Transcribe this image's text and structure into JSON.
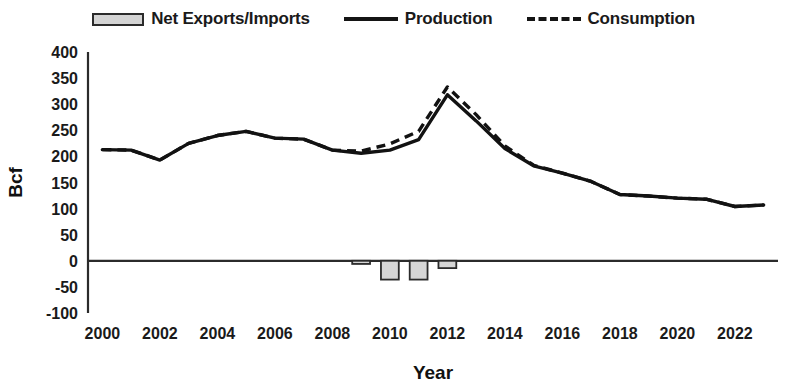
{
  "legend": {
    "items": [
      {
        "label": "Net Exports/Imports",
        "marker": "bar-swatch-icon"
      },
      {
        "label": "Production",
        "marker": "solid-line-icon"
      },
      {
        "label": "Consumption",
        "marker": "dashed-line-icon"
      }
    ]
  },
  "axes": {
    "ylabel": "Bcf",
    "xlabel": "Year",
    "y_ticks": [
      "400",
      "350",
      "300",
      "250",
      "200",
      "150",
      "100",
      "50",
      "0",
      "-50",
      "-100"
    ],
    "x_ticks": [
      "2000",
      "2002",
      "2004",
      "2006",
      "2008",
      "2010",
      "2012",
      "2014",
      "2016",
      "2018",
      "2020",
      "2022"
    ]
  },
  "colors": {
    "line": "#121212",
    "bar_fill": "#d6d6d6",
    "bar_stroke": "#2b2b2b",
    "axis": "#2b2b2b",
    "background": "#ffffff"
  },
  "chart_data": {
    "type": "line",
    "title": "",
    "xlabel": "Year",
    "ylabel": "Bcf",
    "xlim": [
      1999.5,
      2023.5
    ],
    "ylim": [
      -100,
      400
    ],
    "ytick_step": 50,
    "xtick_step": 2,
    "grid": false,
    "legend_position": "top",
    "x": [
      2000,
      2001,
      2002,
      2003,
      2004,
      2005,
      2006,
      2007,
      2008,
      2009,
      2010,
      2011,
      2012,
      2013,
      2014,
      2015,
      2016,
      2017,
      2018,
      2019,
      2020,
      2021,
      2022,
      2023
    ],
    "series": [
      {
        "name": "Production",
        "type": "line",
        "style": "solid",
        "values": [
          213,
          212,
          193,
          225,
          240,
          248,
          235,
          233,
          212,
          206,
          212,
          232,
          318,
          268,
          215,
          182,
          168,
          152,
          127,
          124,
          120,
          118,
          104,
          107
        ]
      },
      {
        "name": "Consumption",
        "type": "line",
        "style": "dashed",
        "values": [
          213,
          212,
          193,
          225,
          240,
          248,
          235,
          233,
          212,
          210,
          224,
          248,
          333,
          280,
          220,
          183,
          168,
          152,
          127,
          124,
          120,
          118,
          104,
          107
        ]
      },
      {
        "name": "Net Exports/Imports",
        "type": "bar",
        "values": [
          0,
          0,
          0,
          0,
          0,
          0,
          0,
          0,
          0,
          -6,
          -36,
          -36,
          -14,
          0,
          0,
          0,
          0,
          0,
          0,
          0,
          0,
          0,
          0,
          0
        ]
      }
    ]
  },
  "layout": {
    "plot_left": 88,
    "plot_right": 778,
    "plot_top": 52,
    "plot_bottom": 313,
    "zero_y": 263
  }
}
